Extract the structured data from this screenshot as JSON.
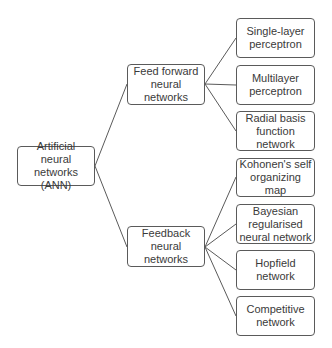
{
  "diagram": {
    "root": {
      "label": "Artificial neural\nnetworks (ANN)"
    },
    "branches": [
      {
        "label": "Feed forward\nneural\nnetworks",
        "children": [
          {
            "label": "Single-layer\nperceptron"
          },
          {
            "label": "Multilayer\nperceptron"
          },
          {
            "label": "Radial basis\nfunction\nnetwork"
          }
        ]
      },
      {
        "label": "Feedback\nneural\nnetworks",
        "children": [
          {
            "label": "Kohonen's self\norganizing map"
          },
          {
            "label": "Bayesian\nregularised\nneural network"
          },
          {
            "label": "Hopfield\nnetwork"
          },
          {
            "label": "Competitive\nnetwork"
          }
        ]
      }
    ]
  },
  "colors": {
    "border": "#5a5a5a",
    "text": "#3a3a3a",
    "background": "#ffffff"
  }
}
